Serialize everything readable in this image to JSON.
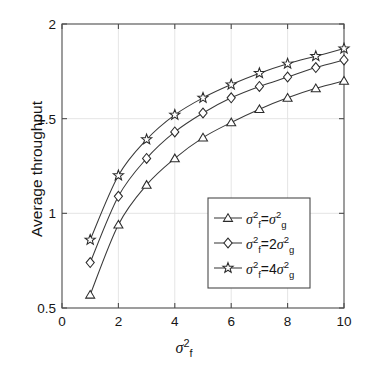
{
  "chart_data": {
    "type": "line",
    "title": "",
    "xlabel": "sigma_f^2",
    "xlabel_text": "σ",
    "ylabel": "Average throughput",
    "xlim": [
      0,
      10
    ],
    "ylim": [
      0.5,
      2
    ],
    "xticks": [
      0,
      2,
      4,
      6,
      8,
      10
    ],
    "xtick_labels": [
      "0",
      "2",
      "4",
      "6",
      "8",
      "10"
    ],
    "yticks": [
      0.5,
      1,
      1.5,
      2
    ],
    "ytick_labels": [
      "0.5",
      "1",
      "1.5",
      "2"
    ],
    "grid": true,
    "legend_position": "lower right",
    "x": [
      1,
      2,
      3,
      4,
      5,
      6,
      7,
      8,
      9,
      10
    ],
    "series": [
      {
        "name": "sigma_f^2 = sigma_g^2",
        "marker": "triangle",
        "values": [
          0.57,
          0.94,
          1.15,
          1.29,
          1.4,
          1.48,
          1.55,
          1.61,
          1.66,
          1.7
        ]
      },
      {
        "name": "sigma_f^2 = 2 sigma_g^2",
        "marker": "diamond",
        "values": [
          0.74,
          1.09,
          1.29,
          1.43,
          1.53,
          1.61,
          1.67,
          1.72,
          1.77,
          1.81
        ]
      },
      {
        "name": "sigma_f^2 = 4 sigma_g^2",
        "marker": "star",
        "values": [
          0.86,
          1.2,
          1.39,
          1.52,
          1.61,
          1.68,
          1.74,
          1.79,
          1.83,
          1.87
        ]
      }
    ],
    "legend_entries": [
      {
        "marker": "triangle",
        "coefficient": "",
        "base": "σ",
        "sub_left": "f",
        "sub_right": "g",
        "sup": "2"
      },
      {
        "marker": "diamond",
        "coefficient": "2",
        "base": "σ",
        "sub_left": "f",
        "sub_right": "g",
        "sup": "2"
      },
      {
        "marker": "star",
        "coefficient": "4",
        "base": "σ",
        "sub_left": "f",
        "sub_right": "g",
        "sup": "2"
      }
    ],
    "colors": {
      "line": "#3a3a3a",
      "axis": "#4d4d4d",
      "grid": "#e2e2e2",
      "background": "#ffffff",
      "marker_fill": "#ffffff"
    }
  },
  "axes": {
    "y_title": "Average throughput"
  },
  "legend": {
    "entry_0_prefix": "σ",
    "entry_0_equals": "=",
    "entry_1_equals": "=",
    "entry_2_equals": "=",
    "entry_1_coefficient": "2",
    "entry_2_coefficient": "4",
    "sub_f": "f",
    "sub_g": "g",
    "sup_2": "2"
  }
}
